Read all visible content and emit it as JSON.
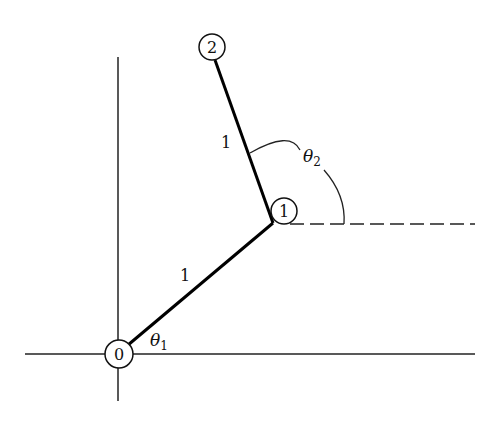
{
  "diagram": {
    "type": "two-link planar arm",
    "joints": [
      {
        "id": "0",
        "label": "0",
        "x": 119,
        "y": 354
      },
      {
        "id": "1",
        "label": "1",
        "x": 284,
        "y": 211
      },
      {
        "id": "2",
        "label": "2",
        "x": 212,
        "y": 47
      }
    ],
    "links": [
      {
        "from": "0",
        "to": "1",
        "length_label": "1"
      },
      {
        "from": "1",
        "to": "2",
        "length_label": "1"
      }
    ],
    "angles": [
      {
        "symbol": "θ",
        "subscript": "1"
      },
      {
        "symbol": "θ",
        "subscript": "2"
      }
    ],
    "colors": {
      "ink": "#111111",
      "background": "#ffffff"
    }
  }
}
